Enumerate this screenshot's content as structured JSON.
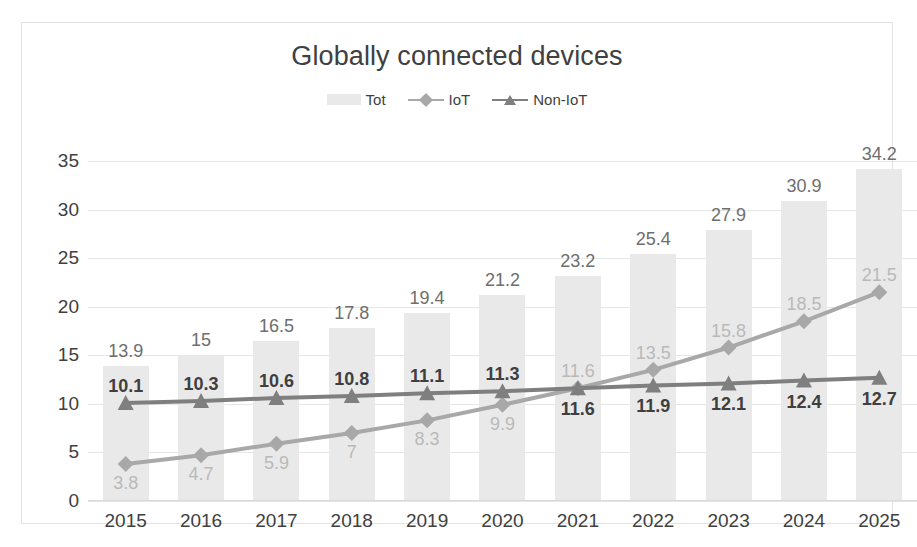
{
  "chart_data": {
    "type": "bar",
    "title": "Globally connected devices",
    "xlabel": "",
    "ylabel": "",
    "ylim": [
      0,
      35
    ],
    "yticks": [
      0,
      5,
      10,
      15,
      20,
      25,
      30,
      35
    ],
    "grid": true,
    "legend_position": "top-center",
    "categories": [
      "2015",
      "2016",
      "2017",
      "2018",
      "2019",
      "2020",
      "2021",
      "2022",
      "2023",
      "2024",
      "2025"
    ],
    "series": [
      {
        "name": "Tot",
        "type": "bar",
        "color": "#e9e9e9",
        "values": [
          13.9,
          15,
          16.5,
          17.8,
          19.4,
          21.2,
          23.2,
          25.4,
          27.9,
          30.9,
          34.2
        ],
        "labels": [
          "13.9",
          "15",
          "16.5",
          "17.8",
          "19.4",
          "21.2",
          "23.2",
          "25.4",
          "27.9",
          "30.9",
          "34.2"
        ]
      },
      {
        "name": "IoT",
        "type": "line",
        "marker": "diamond",
        "color": "#a8a8a8",
        "values": [
          3.8,
          4.7,
          5.9,
          7,
          8.3,
          9.9,
          11.6,
          13.5,
          15.8,
          18.5,
          21.5
        ],
        "labels": [
          "3.8",
          "4.7",
          "5.9",
          "7",
          "8.3",
          "9.9",
          "11.6",
          "13.5",
          "15.8",
          "18.5",
          "21.5"
        ],
        "label_positions": [
          "below",
          "below",
          "below",
          "below",
          "below",
          "below",
          "above",
          "above",
          "above",
          "above",
          "above"
        ]
      },
      {
        "name": "Non-IoT",
        "type": "line",
        "marker": "triangle",
        "color": "#7f7f7f",
        "values": [
          10.1,
          10.3,
          10.6,
          10.8,
          11.1,
          11.3,
          11.6,
          11.9,
          12.1,
          12.4,
          12.7
        ],
        "labels": [
          "10.1",
          "10.3",
          "10.6",
          "10.8",
          "11.1",
          "11.3",
          "11.6",
          "11.9",
          "12.1",
          "12.4",
          "12.7"
        ],
        "label_positions": [
          "above",
          "above",
          "above",
          "above",
          "above",
          "above",
          "below",
          "below",
          "below",
          "below",
          "below"
        ]
      }
    ]
  },
  "legend": {
    "items": [
      {
        "label": "Tot",
        "marker": "square-swatch"
      },
      {
        "label": "IoT",
        "marker": "line-diamond"
      },
      {
        "label": "Non-IoT",
        "marker": "line-triangle"
      }
    ]
  }
}
